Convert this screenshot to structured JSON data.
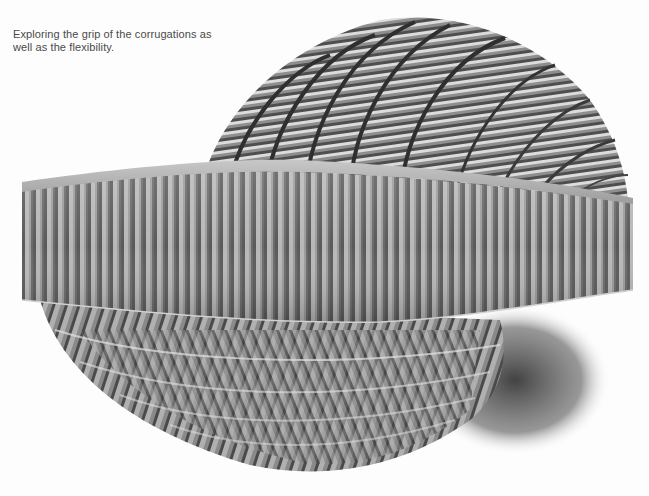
{
  "caption": {
    "line1": "Exploring the grip of the corrugations as",
    "line2": "well as the flexibility."
  },
  "photo": {
    "subject": "corrugated cardboard sculpture",
    "style": "black-and-white photograph",
    "colors": {
      "background": "#fdfdfd",
      "light_rib": "#c9c9c9",
      "mid_rib": "#8e8e8e",
      "dark_rib": "#4f4f4f",
      "shadow": "#3a3a3a",
      "caption_text": "#4a4a4a"
    }
  }
}
